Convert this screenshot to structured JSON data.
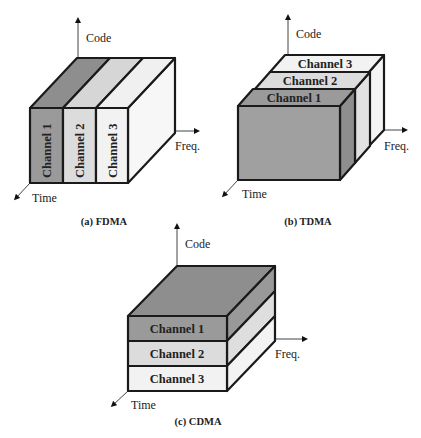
{
  "figure": {
    "panels": [
      {
        "id": "fdma",
        "caption": "(a) FDMA",
        "axes": {
          "y": "Code",
          "x": "Freq.",
          "z": "Time"
        },
        "channels": [
          {
            "label": "Channel 1",
            "color": "#9a9a9a"
          },
          {
            "label": "Channel 2",
            "color": "#dcdcdc"
          },
          {
            "label": "Channel 3",
            "color": "#f2f2f2"
          }
        ],
        "division": "frequency"
      },
      {
        "id": "tdma",
        "caption": "(b) TDMA",
        "axes": {
          "y": "Code",
          "x": "Freq.",
          "z": "Time"
        },
        "channels": [
          {
            "label": "Channel 1",
            "color": "#9a9a9a"
          },
          {
            "label": "Channel 2",
            "color": "#dcdcdc"
          },
          {
            "label": "Channel 3",
            "color": "#f2f2f2"
          }
        ],
        "division": "time"
      },
      {
        "id": "cdma",
        "caption": "(c) CDMA",
        "axes": {
          "y": "Code",
          "x": "Freq.",
          "z": "Time"
        },
        "channels": [
          {
            "label": "Channel 1",
            "color": "#9a9a9a"
          },
          {
            "label": "Channel 2",
            "color": "#dcdcdc"
          },
          {
            "label": "Channel 3",
            "color": "#f2f2f2"
          }
        ],
        "division": "code"
      }
    ]
  }
}
